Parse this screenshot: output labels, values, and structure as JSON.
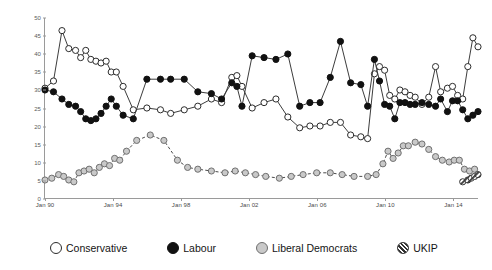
{
  "chart_data": {
    "type": "line",
    "title": "",
    "subtitle": "",
    "xlabel": "",
    "ylabel": "",
    "ylim": [
      0,
      50
    ],
    "xlim": [
      1990.0,
      2015.5
    ],
    "grid": false,
    "legend_position": "bottom",
    "yticks": [
      0,
      5,
      10,
      15,
      20,
      25,
      30,
      35,
      40,
      45,
      50
    ],
    "ytick_labels": [
      "0",
      "5",
      "10",
      "15",
      "20",
      "25",
      "30",
      "35",
      "40",
      "45",
      "50"
    ],
    "xticks": [
      1990,
      1994,
      1998,
      2002,
      2006,
      2010,
      2014
    ],
    "xtick_labels": [
      "Jan 90",
      "Jan 94",
      "Jan 98",
      "Jan 02",
      "Jan 06",
      "Jan 10",
      "Jan 14"
    ],
    "series": [
      {
        "name": "Conservative",
        "marker": "open-circle",
        "color": "#ffffff",
        "edge_color": "#2a2a2a",
        "line_style": "solid",
        "points": [
          [
            1990.0,
            30.5
          ],
          [
            1990.5,
            32.5
          ],
          [
            1991.0,
            46.5
          ],
          [
            1991.4,
            41.5
          ],
          [
            1991.8,
            41.0
          ],
          [
            1992.1,
            39.0
          ],
          [
            1992.4,
            41.0
          ],
          [
            1992.7,
            38.5
          ],
          [
            1993.0,
            38.0
          ],
          [
            1993.3,
            37.5
          ],
          [
            1993.6,
            38.0
          ],
          [
            1993.9,
            35.0
          ],
          [
            1994.2,
            35.0
          ],
          [
            1994.6,
            31.0
          ],
          [
            1995.2,
            24.5
          ],
          [
            1996.0,
            25.0
          ],
          [
            1996.8,
            24.5
          ],
          [
            1997.4,
            23.5
          ],
          [
            1998.2,
            24.5
          ],
          [
            1999.0,
            25.5
          ],
          [
            1999.8,
            27.5
          ],
          [
            2000.4,
            26.5
          ],
          [
            2001.0,
            33.5
          ],
          [
            2001.3,
            34.0
          ],
          [
            2001.6,
            31.0
          ],
          [
            2002.2,
            25.0
          ],
          [
            2002.9,
            26.5
          ],
          [
            2003.6,
            27.5
          ],
          [
            2004.3,
            22.5
          ],
          [
            2005.0,
            19.5
          ],
          [
            2005.6,
            20.0
          ],
          [
            2006.2,
            20.0
          ],
          [
            2006.8,
            21.0
          ],
          [
            2007.4,
            21.0
          ],
          [
            2008.0,
            17.5
          ],
          [
            2008.6,
            17.0
          ],
          [
            2009.0,
            16.5
          ],
          [
            2009.4,
            34.5
          ],
          [
            2009.7,
            36.5
          ],
          [
            2010.0,
            35.5
          ],
          [
            2010.3,
            28.5
          ],
          [
            2010.6,
            27.5
          ],
          [
            2010.9,
            30.0
          ],
          [
            2011.2,
            29.5
          ],
          [
            2011.5,
            28.5
          ],
          [
            2011.8,
            28.0
          ],
          [
            2012.2,
            26.0
          ],
          [
            2012.6,
            28.0
          ],
          [
            2013.0,
            36.5
          ],
          [
            2013.3,
            29.5
          ],
          [
            2013.7,
            30.5
          ],
          [
            2014.0,
            31.0
          ],
          [
            2014.3,
            28.5
          ],
          [
            2014.6,
            27.5
          ],
          [
            2014.9,
            36.5
          ],
          [
            2015.2,
            44.5
          ],
          [
            2015.5,
            42.0
          ]
        ]
      },
      {
        "name": "Labour",
        "marker": "filled-circle",
        "color": "#111111",
        "edge_color": "#111111",
        "line_style": "solid",
        "points": [
          [
            1990.0,
            30.0
          ],
          [
            1990.5,
            29.5
          ],
          [
            1991.0,
            27.5
          ],
          [
            1991.4,
            26.0
          ],
          [
            1991.8,
            25.5
          ],
          [
            1992.1,
            24.0
          ],
          [
            1992.4,
            22.0
          ],
          [
            1992.7,
            21.5
          ],
          [
            1993.0,
            22.0
          ],
          [
            1993.3,
            23.5
          ],
          [
            1993.6,
            25.5
          ],
          [
            1993.9,
            27.5
          ],
          [
            1994.2,
            25.5
          ],
          [
            1994.6,
            23.0
          ],
          [
            1995.2,
            22.0
          ],
          [
            1996.0,
            33.0
          ],
          [
            1996.8,
            33.0
          ],
          [
            1997.4,
            33.0
          ],
          [
            1998.2,
            33.0
          ],
          [
            1999.0,
            29.5
          ],
          [
            1999.8,
            29.0
          ],
          [
            2000.4,
            27.5
          ],
          [
            2001.0,
            32.0
          ],
          [
            2001.3,
            31.0
          ],
          [
            2001.6,
            25.5
          ],
          [
            2002.2,
            39.5
          ],
          [
            2002.9,
            39.0
          ],
          [
            2003.6,
            38.5
          ],
          [
            2004.3,
            40.0
          ],
          [
            2005.0,
            25.5
          ],
          [
            2005.6,
            26.5
          ],
          [
            2006.2,
            26.5
          ],
          [
            2006.8,
            33.5
          ],
          [
            2007.4,
            43.5
          ],
          [
            2008.0,
            32.0
          ],
          [
            2008.6,
            31.5
          ],
          [
            2009.0,
            25.5
          ],
          [
            2009.4,
            38.5
          ],
          [
            2009.7,
            32.5
          ],
          [
            2010.0,
            26.0
          ],
          [
            2010.3,
            25.5
          ],
          [
            2010.6,
            22.0
          ],
          [
            2010.9,
            26.5
          ],
          [
            2011.2,
            26.5
          ],
          [
            2011.5,
            26.0
          ],
          [
            2011.8,
            26.0
          ],
          [
            2012.2,
            26.5
          ],
          [
            2012.6,
            26.0
          ],
          [
            2013.0,
            25.5
          ],
          [
            2013.3,
            27.5
          ],
          [
            2013.7,
            24.0
          ],
          [
            2014.0,
            27.0
          ],
          [
            2014.3,
            27.0
          ],
          [
            2014.6,
            24.5
          ],
          [
            2014.9,
            22.0
          ],
          [
            2015.2,
            23.0
          ],
          [
            2015.5,
            24.0
          ]
        ]
      },
      {
        "name": "Liberal Democrats",
        "marker": "gray-circle",
        "color": "#c9c9c9",
        "edge_color": "#6f6f6f",
        "line_style": "dashed",
        "points": [
          [
            1990.0,
            5.0
          ],
          [
            1990.4,
            5.5
          ],
          [
            1990.8,
            6.5
          ],
          [
            1991.1,
            6.0
          ],
          [
            1991.4,
            5.0
          ],
          [
            1991.7,
            4.5
          ],
          [
            1992.0,
            7.0
          ],
          [
            1992.3,
            7.5
          ],
          [
            1992.6,
            8.0
          ],
          [
            1992.9,
            7.0
          ],
          [
            1993.2,
            8.5
          ],
          [
            1993.5,
            9.5
          ],
          [
            1993.8,
            9.0
          ],
          [
            1994.1,
            11.0
          ],
          [
            1994.4,
            10.5
          ],
          [
            1994.8,
            13.0
          ],
          [
            1995.4,
            16.0
          ],
          [
            1996.2,
            17.5
          ],
          [
            1997.0,
            16.0
          ],
          [
            1997.8,
            10.5
          ],
          [
            1998.4,
            8.5
          ],
          [
            1999.0,
            8.0
          ],
          [
            1999.8,
            7.5
          ],
          [
            2000.6,
            7.0
          ],
          [
            2001.2,
            7.5
          ],
          [
            2001.8,
            7.0
          ],
          [
            2002.4,
            6.5
          ],
          [
            2003.0,
            6.0
          ],
          [
            2003.8,
            5.5
          ],
          [
            2004.5,
            6.0
          ],
          [
            2005.2,
            6.5
          ],
          [
            2006.0,
            7.0
          ],
          [
            2006.8,
            7.0
          ],
          [
            2007.5,
            6.5
          ],
          [
            2008.2,
            6.0
          ],
          [
            2009.0,
            6.0
          ],
          [
            2009.5,
            6.5
          ],
          [
            2009.9,
            9.5
          ],
          [
            2010.2,
            13.0
          ],
          [
            2010.5,
            11.0
          ],
          [
            2010.8,
            12.5
          ],
          [
            2011.1,
            14.5
          ],
          [
            2011.4,
            14.5
          ],
          [
            2011.8,
            15.5
          ],
          [
            2012.2,
            15.0
          ],
          [
            2012.6,
            13.5
          ],
          [
            2013.0,
            11.5
          ],
          [
            2013.4,
            10.5
          ],
          [
            2013.8,
            10.0
          ],
          [
            2014.1,
            10.5
          ],
          [
            2014.4,
            10.5
          ],
          [
            2014.7,
            8.0
          ],
          [
            2015.0,
            7.5
          ],
          [
            2015.3,
            8.0
          ]
        ]
      },
      {
        "name": "UKIP",
        "marker": "hatched-circle",
        "color": "#ffffff",
        "edge_color": "#3a3a3a",
        "line_style": "solid",
        "points": [
          [
            2014.6,
            4.5
          ],
          [
            2014.9,
            5.0
          ],
          [
            2015.1,
            5.5
          ],
          [
            2015.3,
            6.0
          ],
          [
            2015.5,
            6.5
          ]
        ]
      }
    ]
  },
  "legend": {
    "items": [
      {
        "label": "Conservative",
        "swatch": "open-circle-icon"
      },
      {
        "label": "Labour",
        "swatch": "filled-circle-icon"
      },
      {
        "label": "Liberal Democrats",
        "swatch": "gray-circle-icon"
      },
      {
        "label": "UKIP",
        "swatch": "hatched-circle-icon"
      }
    ]
  }
}
